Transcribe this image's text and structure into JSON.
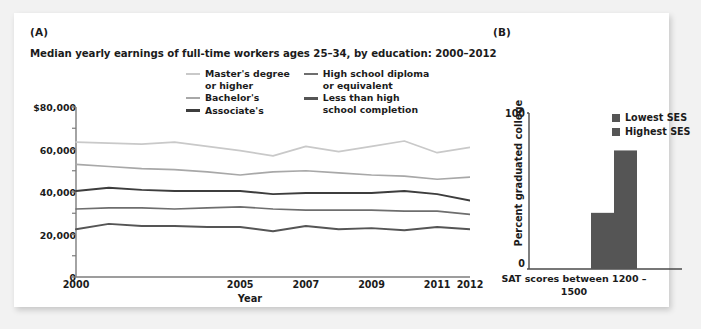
{
  "figure": {
    "panel_a_label": "(A)",
    "panel_b_label": "(B)"
  },
  "chart_data": [
    {
      "type": "line",
      "panel": "(A)",
      "title": "Median yearly earnings of full-time workers ages 25–34, by education: 2000–2012",
      "xlabel": "Year",
      "ylabel": "",
      "x": [
        2000,
        2001,
        2002,
        2003,
        2004,
        2005,
        2006,
        2007,
        2008,
        2009,
        2010,
        2011,
        2012
      ],
      "xlim": [
        2000,
        2012
      ],
      "ylim": [
        0,
        80000
      ],
      "xtick_labels": [
        "2000",
        "2005",
        "2007",
        "2009",
        "2011",
        "2012"
      ],
      "xtick_values": [
        2000,
        2005,
        2007,
        2009,
        2011,
        2012
      ],
      "ytick_labels": [
        "$80,000",
        "60,000",
        "40,000",
        "20,000",
        "0"
      ],
      "ytick_values": [
        80000,
        60000,
        40000,
        20000,
        0
      ],
      "grid": false,
      "legend_position": "upper-center",
      "series": [
        {
          "name": "Master's degree\nor higher",
          "color": "#c9c9c9",
          "values": [
            63500,
            63000,
            62500,
            63500,
            61500,
            59500,
            57000,
            61500,
            59000,
            61500,
            64000,
            58500,
            61000,
            60500
          ]
        },
        {
          "name": "Bachelor's",
          "color": "#a8a8a8",
          "values": [
            53000,
            52000,
            51000,
            50500,
            49500,
            48000,
            49500,
            50000,
            49000,
            48000,
            47500,
            46000,
            47000
          ]
        },
        {
          "name": "Associate's",
          "color": "#3d3d3d",
          "values": [
            40500,
            42000,
            41000,
            40500,
            40500,
            40500,
            39000,
            39500,
            39500,
            39500,
            40500,
            39000,
            36000
          ]
        },
        {
          "name": "High school diploma\nor equivalent",
          "color": "#6e6e6e",
          "values": [
            32000,
            32500,
            32500,
            32000,
            32500,
            33000,
            32000,
            31500,
            31500,
            31500,
            31000,
            31000,
            29500
          ]
        },
        {
          "name": "Less than high\nschool completion",
          "color": "#555555",
          "values": [
            22500,
            25000,
            24000,
            24000,
            23500,
            23500,
            21500,
            24000,
            22500,
            23000,
            22000,
            23500,
            22500
          ]
        }
      ]
    },
    {
      "type": "bar",
      "panel": "(B)",
      "title": "",
      "xlabel": "SAT scores between\n1200 – 1500",
      "ylabel": "Percent graduated college",
      "categories": [
        "SAT scores between 1200 – 1500"
      ],
      "ytick_labels": [
        "100",
        "0"
      ],
      "ytick_values": [
        100,
        0
      ],
      "ylim": [
        0,
        100
      ],
      "grid": false,
      "legend_position": "upper-right",
      "bar_color": "#555555",
      "series": [
        {
          "name": "Lowest SES",
          "values": [
            36
          ]
        },
        {
          "name": "Highest SES",
          "values": [
            76
          ]
        }
      ]
    }
  ]
}
